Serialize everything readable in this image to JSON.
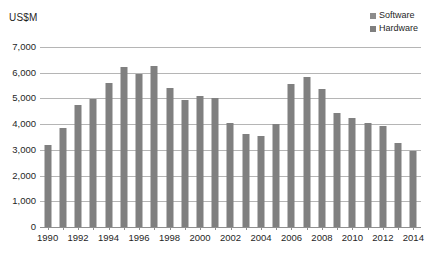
{
  "axis_unit_label": "US$M",
  "legend": {
    "position": "top-right",
    "entries": [
      {
        "label": "Software",
        "color": "#8c8c8c",
        "icon": "square-swatch-icon"
      },
      {
        "label": "Hardware",
        "color": "#7f7f7f",
        "icon": "square-swatch-icon"
      }
    ]
  },
  "chart_data": {
    "type": "bar",
    "title": "",
    "subtitle": "",
    "xlabel": "",
    "ylabel": "US$M",
    "ylim": [
      0,
      7000
    ],
    "ytick_step": 1000,
    "ytick_labels": [
      "0",
      "1,000",
      "2,000",
      "3,000",
      "4,000",
      "5,000",
      "6,000",
      "7,000"
    ],
    "ytick_values": [
      0,
      1000,
      2000,
      3000,
      4000,
      5000,
      6000,
      7000
    ],
    "grid": true,
    "grid_axis": "y",
    "legend_position": "top-right",
    "bar_color": "#808080",
    "categories": [
      "1990",
      "1991",
      "1992",
      "1993",
      "1994",
      "1995",
      "1996",
      "1997",
      "1998",
      "1999",
      "2000",
      "2001",
      "2002",
      "2003",
      "2004",
      "2005",
      "2006",
      "2007",
      "2008",
      "2009",
      "2010",
      "2011",
      "2012",
      "2013",
      "2014"
    ],
    "xtick_labels_shown": [
      "1990",
      "1992",
      "1994",
      "1996",
      "1998",
      "2000",
      "2002",
      "2004",
      "2006",
      "2008",
      "2010",
      "2012",
      "2014"
    ],
    "series": [
      {
        "name": "Hardware",
        "color": "#808080",
        "values": [
          3200,
          3870,
          4760,
          4980,
          5600,
          6230,
          5950,
          6250,
          5400,
          4950,
          5100,
          5020,
          4060,
          3630,
          3540,
          4010,
          5550,
          5850,
          5350,
          4420,
          4230,
          4060,
          3920,
          3250,
          2950
        ]
      }
    ]
  }
}
